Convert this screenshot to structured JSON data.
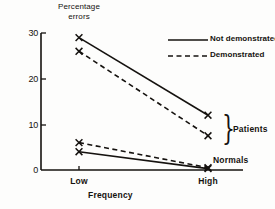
{
  "chart_data": {
    "type": "line",
    "title": "",
    "xlabel": "Frequency",
    "ylabel": "Percentage errors",
    "categories": [
      "Low",
      "High"
    ],
    "x": [
      79,
      208
    ],
    "xlim": [
      0,
      1
    ],
    "ylim": [
      0,
      30
    ],
    "yticks": [
      0,
      10,
      20,
      30
    ],
    "ytick_labels": [
      "0",
      "10",
      "20",
      "30"
    ],
    "grid": false,
    "marker": "x",
    "legend_position": "upper-right",
    "series": [
      {
        "name": "Not demonstrated",
        "group": "Patients",
        "style": "solid",
        "values": [
          29,
          12
        ]
      },
      {
        "name": "Demonstrated",
        "group": "Patients",
        "style": "dashed",
        "values": [
          26,
          7.5
        ]
      },
      {
        "name": "Demonstrated",
        "group": "Normals",
        "style": "dashed",
        "values": [
          6,
          0.5
        ]
      },
      {
        "name": "Not demonstrated",
        "group": "Normals",
        "style": "solid",
        "values": [
          4,
          0.3
        ]
      }
    ],
    "annotations": [
      {
        "text": "Patients",
        "kind": "group-brace"
      },
      {
        "text": "Normals",
        "kind": "group-label"
      }
    ],
    "line_color": "#15120f"
  },
  "legend": {
    "entries": [
      {
        "label": "Not demonstrated",
        "style": "solid"
      },
      {
        "label": "Demonstrated",
        "style": "dashed"
      }
    ]
  },
  "axes": {
    "y_label_line1": "Percentage",
    "y_label_line2": "errors",
    "x_title": "Frequency",
    "y_ticks": [
      "30",
      "20",
      "10",
      "0"
    ],
    "x_ticks": [
      "Low",
      "High"
    ]
  },
  "groups": {
    "patients": "Patients",
    "normals": "Normals"
  },
  "colors": {
    "ink": "#15120f",
    "background": "#fdfdfc"
  }
}
